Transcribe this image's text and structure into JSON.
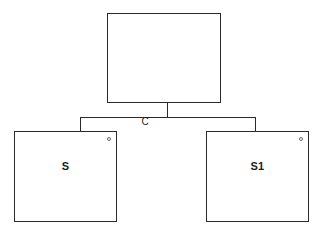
{
  "diagram": {
    "type": "hierarchy-tree",
    "background_color": "#ffffff",
    "line_color": "#2a2a2a",
    "text_color": "#1c1c1c",
    "nodes": [
      {
        "id": "root",
        "label": "",
        "role": "parent",
        "has_corner_marker": false
      },
      {
        "id": "child-left",
        "label": "S",
        "role": "child",
        "has_corner_marker": true
      },
      {
        "id": "child-right",
        "label": "S1",
        "role": "child",
        "has_corner_marker": true
      }
    ],
    "edges": [
      {
        "id": "edge-root-children",
        "label": "C",
        "from": "root",
        "to": [
          "child-left",
          "child-right"
        ]
      }
    ],
    "icons": {
      "corner_marker": "small-circle-icon"
    }
  }
}
